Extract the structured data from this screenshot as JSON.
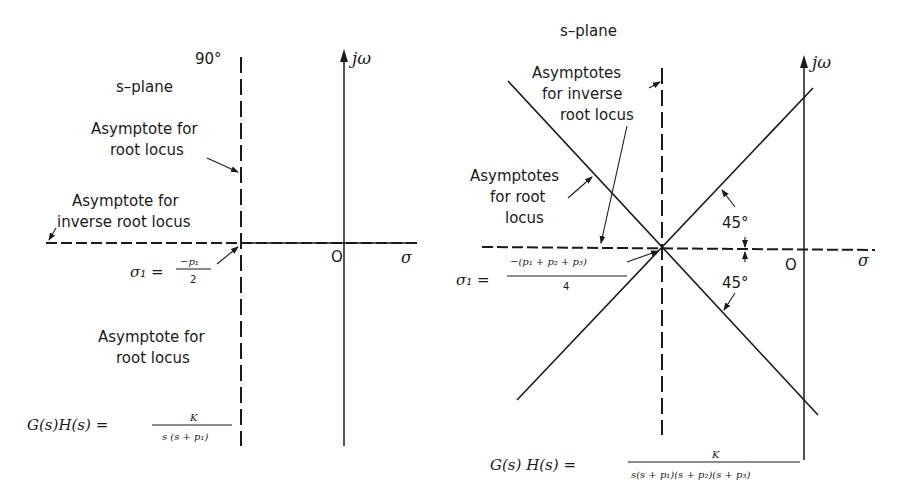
{
  "left_panel": {
    "angle_label": "90°",
    "plane_label": "s–plane",
    "jw_label": "jω",
    "sigma_label": "σ",
    "origin_label": "O",
    "asymptote_root_top": [
      "Asymptote for",
      "root locus"
    ],
    "asymptote_inverse": [
      "Asymptote for",
      "inverse root locus"
    ],
    "asymptote_root_bottom": [
      "Asymptote for",
      "root locus"
    ],
    "sigma1": {
      "lhs": "σ₁ =",
      "numerator": "−p₁",
      "denominator": "2"
    },
    "transfer_function": {
      "lhs": "G(s)H(s) =",
      "numerator": "K",
      "denominator": "s (s + p₁)"
    }
  },
  "right_panel": {
    "plane_label": "s–plane",
    "jw_label": "jω",
    "sigma_label": "σ",
    "origin_label": "O",
    "asymptotes_inverse": [
      "Asymptotes",
      "for inverse",
      "root locus"
    ],
    "asymptotes_root": [
      "Asymptotes",
      "for root",
      "locus"
    ],
    "angle_upper": "45°",
    "angle_lower": "45°",
    "sigma1": {
      "lhs": "σ₁ =",
      "numerator": "−(p₁ + p₂ + p₃)",
      "denominator": "4"
    },
    "transfer_function": {
      "lhs": "G(s) H(s) =",
      "numerator": "K",
      "denominator": "s(s + p₁)(s + p₂)(s + p₃)"
    }
  }
}
